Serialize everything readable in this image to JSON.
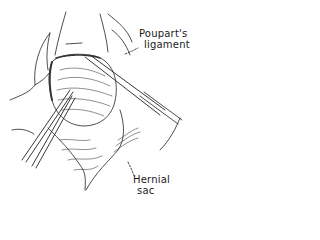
{
  "figure": {
    "labels": {
      "poupart": {
        "line1": "Poupart's",
        "line2": "ligament"
      },
      "hernial_sac": {
        "line1": "Hernial",
        "line2": "sac"
      }
    },
    "colors": {
      "ink": "#1a1a1a",
      "background": "#ffffff"
    }
  }
}
